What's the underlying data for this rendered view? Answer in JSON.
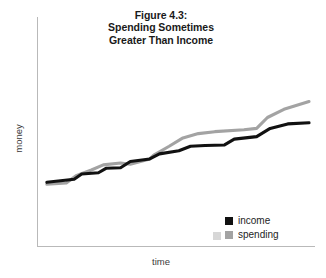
{
  "chart_data": {
    "type": "line",
    "title": "Figure 4.3: Spending Sometimes Greater Than Income",
    "title_lines": [
      "Figure 4.3:",
      "Spending Sometimes",
      "Greater Than Income"
    ],
    "xlabel": "time",
    "ylabel": "money",
    "grid": false,
    "legend_position": "bottom-right",
    "axis_note": "Axes are unlabeled schematic axes: time increases left to right, money increases bottom to top. No tick marks or numeric tick labels are drawn.",
    "xlim": [
      0,
      100
    ],
    "ylim": [
      0,
      100
    ],
    "series": [
      {
        "name": "income",
        "color": "#111111",
        "x": [
          1.8,
          11.9,
          14.7,
          20.9,
          23.7,
          29.1,
          32.7,
          39.9,
          43.5,
          50.7,
          55.0,
          60.4,
          67.6,
          71.2,
          79.5,
          84.5,
          91.0,
          98.9
        ],
        "y": [
          17.9,
          20.0,
          23.5,
          24.3,
          27.3,
          27.7,
          31.9,
          33.6,
          37.0,
          39.1,
          42.1,
          42.6,
          43.0,
          46.9,
          48.6,
          54.1,
          57.1,
          57.9
        ]
      },
      {
        "name": "spending",
        "color": "#a3a3a3",
        "x": [
          1.8,
          9.0,
          12.6,
          18.3,
          22.7,
          29.1,
          32.7,
          39.9,
          41.4,
          47.1,
          52.2,
          57.9,
          64.0,
          74.8,
          79.5,
          83.5,
          89.6,
          98.9
        ],
        "y": [
          16.6,
          17.5,
          22.3,
          26.2,
          29.6,
          30.9,
          30.0,
          33.6,
          36.2,
          42.1,
          47.7,
          50.6,
          51.9,
          53.2,
          54.1,
          61.4,
          66.9,
          72.1
        ]
      }
    ]
  },
  "legend": {
    "items": [
      {
        "label": "income",
        "color": "#111111"
      },
      {
        "label": "spending",
        "color": "#a3a3a3"
      }
    ]
  }
}
